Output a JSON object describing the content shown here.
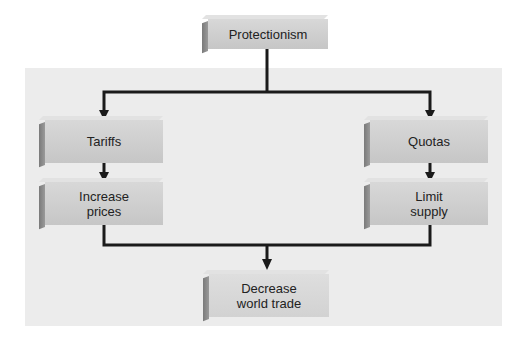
{
  "diagram": {
    "root": {
      "label": "Protectionism"
    },
    "left_branch": {
      "first": {
        "label": "Tariffs"
      },
      "second": {
        "label": "Increase prices",
        "line1": "Increase",
        "line2": "prices"
      }
    },
    "right_branch": {
      "first": {
        "label": "Quotas"
      },
      "second": {
        "label": "Limit supply",
        "line1": "Limit",
        "line2": "supply"
      }
    },
    "result": {
      "label": "Decrease world trade",
      "line1": "Decrease",
      "line2": "world trade"
    }
  },
  "colors": {
    "box_fill": "#d0d0d0",
    "box_side": "#808080",
    "connector": "#1a1a1a",
    "panel": "#ececec"
  }
}
